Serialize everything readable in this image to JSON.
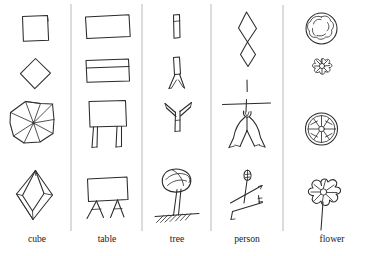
{
  "figure": {
    "type": "sketch-grid",
    "background_color": "#ffffff",
    "ink_color": "#2b2b2b",
    "divider_color": "#9a9a9a",
    "rows": 4,
    "columns": 5,
    "column_labels": [
      "cube",
      "table",
      "tree",
      "person",
      "flower"
    ],
    "column_label_y": 239,
    "divider_x_positions": [
      71,
      142,
      211,
      283
    ],
    "divider_top": 4,
    "divider_bottom": 231,
    "columns_detail": [
      {
        "label": "cube",
        "center_x": 37,
        "cells": [
          {
            "row": 1,
            "name": "square-outline",
            "description": "simple hand-drawn square"
          },
          {
            "row": 2,
            "name": "diamond-outline",
            "description": "square rotated 45 degrees, diamond"
          },
          {
            "row": 3,
            "name": "folded-cube-net",
            "description": "angular polygon with radiating internal creases"
          },
          {
            "row": 4,
            "name": "octahedron-cube",
            "description": "tall diamond with internal faceted diamond, 3d crystal"
          }
        ]
      },
      {
        "label": "table",
        "center_x": 107,
        "cells": [
          {
            "row": 1,
            "name": "rectangle-outline",
            "description": "plain horizontal rectangle"
          },
          {
            "row": 2,
            "name": "rectangle-with-divider",
            "description": "rectangle with a horizontal line near the top"
          },
          {
            "row": 3,
            "name": "table-two-legs",
            "description": "square top with two short straight legs"
          },
          {
            "row": 4,
            "name": "table-splayed-legs",
            "description": "rectangular top on two pairs of splayed legs"
          }
        ]
      },
      {
        "label": "tree",
        "center_x": 177,
        "cells": [
          {
            "row": 1,
            "name": "narrow-bar",
            "description": "small vertical elongated rectangle, trunk stub"
          },
          {
            "row": 2,
            "name": "forked-trunk",
            "description": "vertical stem splitting into two legs at bottom"
          },
          {
            "row": 3,
            "name": "y-branches",
            "description": "trunk with two upward branches forming a Y"
          },
          {
            "row": 4,
            "name": "tree-with-canopy",
            "description": "scribbled round canopy on a trunk above hatched ground"
          }
        ]
      },
      {
        "label": "person",
        "center_x": 247,
        "cells": [
          {
            "row": 1,
            "name": "double-diamond",
            "description": "two diamonds stacked, touching at a point"
          },
          {
            "row": 2,
            "name": "cross-line",
            "description": "single short vertical stroke"
          },
          {
            "row": 3,
            "name": "stick-figure-arms-out",
            "description": "horizontal arm bar, small head, body with two curved legs"
          },
          {
            "row": 4,
            "name": "stick-figure-walking",
            "description": "round head, angled limbs in a walking pose"
          }
        ]
      },
      {
        "label": "flower",
        "center_x": 322,
        "cells": [
          {
            "row": 1,
            "name": "scalloped-circle",
            "description": "circle ringed with small scalloped bumps"
          },
          {
            "row": 2,
            "name": "small-rosette",
            "description": "tiny many-petalled rosette"
          },
          {
            "row": 3,
            "name": "radial-daisy",
            "description": "circle with radial spoke petals inside"
          },
          {
            "row": 4,
            "name": "flower-with-stem",
            "description": "round petalled bloom atop a long straight stem"
          }
        ]
      }
    ]
  }
}
